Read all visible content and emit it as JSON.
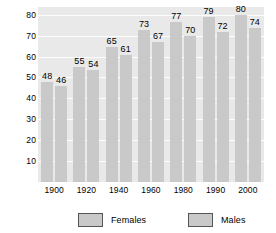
{
  "chart_data": {
    "type": "bar",
    "title": "",
    "xlabel": "",
    "ylabel": "Age",
    "categories": [
      "1900",
      "1920",
      "1940",
      "1960",
      "1980",
      "1990",
      "2000"
    ],
    "series": [
      {
        "name": "Females",
        "values": [
          48,
          55,
          65,
          73,
          77,
          79,
          80
        ],
        "color": "#c9c9c9"
      },
      {
        "name": "Males",
        "values": [
          46,
          54,
          61,
          67,
          70,
          72,
          74
        ],
        "color": "#c9c9c9"
      }
    ],
    "yticks": [
      10,
      20,
      30,
      40,
      50,
      60,
      70,
      80
    ],
    "ylim": [
      0,
      84
    ],
    "grid": true,
    "legend_position": "bottom",
    "show_data_labels": true,
    "plot_background": "#e9e9e9",
    "gridline_color": "#fdfdfd",
    "figure_background": "#ffffff"
  },
  "legend": {
    "entries": [
      {
        "label": "Females"
      },
      {
        "label": "Males"
      }
    ]
  }
}
